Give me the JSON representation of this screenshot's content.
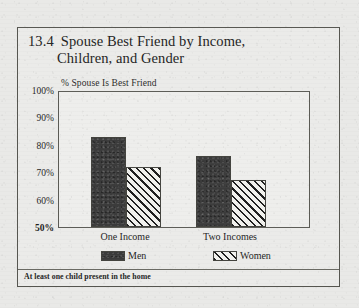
{
  "figure": {
    "number": "13.4",
    "title_line1": "Spouse Best Friend by Income,",
    "title_line2": "Children, and Gender",
    "footnote": "At least one child present in the home"
  },
  "legend": {
    "items": [
      {
        "label": "Men",
        "swatch": "solid-dark"
      },
      {
        "label": "Women",
        "swatch": "diagonal-hatch"
      }
    ]
  },
  "chart_data": {
    "type": "bar",
    "subtitle": "",
    "xlabel": "",
    "ylabel": "% Spouse Is Best Friend",
    "categories": [
      "One Income",
      "Two Incomes"
    ],
    "series": [
      {
        "name": "Men",
        "values": [
          83,
          76
        ],
        "color": "#3b3b3b",
        "fill": "solid-dark"
      },
      {
        "name": "Women",
        "values": [
          72,
          67
        ],
        "color": "#1e1e1e",
        "fill": "diagonal-hatch"
      }
    ],
    "ylim": [
      50,
      100
    ],
    "ytick_values": [
      50,
      60,
      70,
      80,
      90,
      100
    ],
    "ytick_labels": [
      "50%",
      "60%",
      "70%",
      "80%",
      "90%",
      "100%"
    ],
    "grid": false,
    "legend_position": "bottom",
    "annotation": "At least one child present in the home"
  },
  "colors": {
    "paper": "#e9e9e7",
    "ink": "#1f1f1f",
    "frame": "#55554f",
    "bar_men": "#3b3b3b",
    "bar_women_hatch": "#1e1e1e",
    "bar_women_fill": "#f2f2ee"
  }
}
